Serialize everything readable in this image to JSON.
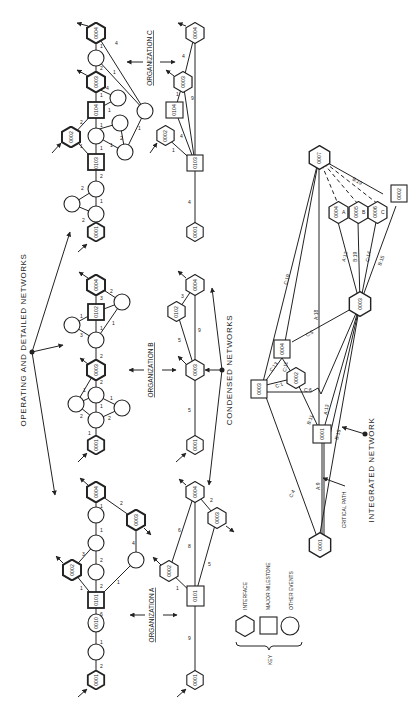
{
  "titles": {
    "operating": "OPERATING AND DETAILED NETWORKS",
    "condensed": "CONDENSED NETWORKS",
    "integrated": "INTEGRATED NETWORK",
    "critical_path": "CRITICAL PATH"
  },
  "organizations": {
    "a": "ORGANIZATION A",
    "b": "ORGANIZATION B",
    "c": "ORGANIZATION C"
  },
  "key": {
    "label": "KEY",
    "items": [
      {
        "shape": "hexagon",
        "label": "INTERFACE"
      },
      {
        "shape": "square",
        "label": "MAJOR MILESTONE"
      },
      {
        "shape": "circle",
        "label": "OTHER EVENTS"
      }
    ]
  },
  "detailed": {
    "a": {
      "nodes": {
        "n0001": "0001",
        "n0010": "0010",
        "n0101": "0101",
        "n0002": "0002",
        "n0003": "0003",
        "n0004": "0004"
      },
      "edges": [
        "2",
        "1",
        "6",
        "1",
        "2",
        "2",
        "3",
        "1",
        "4",
        "2",
        "1",
        "1"
      ]
    },
    "b": {
      "nodes": {
        "n0001": "0001",
        "n0003": "0003",
        "n0102": "0102",
        "n0004": "0004"
      },
      "edges": [
        "1",
        "2",
        "2",
        "1",
        "1",
        "1",
        "2",
        "2",
        "3",
        "1",
        "1",
        "1",
        "3",
        "2"
      ]
    },
    "c": {
      "nodes": {
        "n0001": "0001",
        "n0103": "0103",
        "n0002": "0002",
        "n0104": "0104",
        "n0003": "0003",
        "n0004": "0004"
      },
      "edges": [
        "2",
        "2",
        "1",
        "2",
        "1",
        "1",
        "2",
        "1",
        "1",
        "2",
        "1",
        "1",
        "4",
        "2",
        "1",
        "1",
        "4",
        "1"
      ]
    }
  },
  "condensed": {
    "a": {
      "nodes": {
        "n0001": "0001",
        "n0101": "0101",
        "n0002": "0002",
        "n0003": "0003",
        "n0004": "0004"
      },
      "edges": {
        "e1": "9",
        "e2": "1",
        "e3": "6",
        "e4": "8",
        "e5": "5",
        "e6": "2"
      }
    },
    "b": {
      "nodes": {
        "n0001": "0001",
        "n0003": "0003",
        "n0102": "0102",
        "n0004": "0004"
      },
      "edges": {
        "e1": "5",
        "e2": "5",
        "e3": "9",
        "e4": "3"
      }
    },
    "c": {
      "nodes": {
        "n0001": "0001",
        "n0103": "0103",
        "n0002": "0002",
        "n0104": "0104",
        "n0003": "0003",
        "n0004": "0004"
      },
      "edges": {
        "e1": "4",
        "e2": "1",
        "e3": "4",
        "e4": "1",
        "e5": "9",
        "e6": "4"
      }
    }
  },
  "integrated": {
    "nodes": {
      "n0001": "0001",
      "m0001": "0001",
      "n0002": "0002",
      "n0003": "0003",
      "m0003": "0003",
      "n0004": "0004",
      "n0004a": "0004",
      "n0005b": "0005",
      "n0006c": "0006",
      "n0007": "0007",
      "m0002": "0002"
    },
    "node_subs": {
      "a": "A",
      "b": "B",
      "c": "C"
    },
    "edges": {
      "c19": "C:19",
      "c13": "C:13",
      "c11": "C:11",
      "c1": "C:1",
      "c5": "C:5",
      "c6": "C:6",
      "a18": "A:18",
      "b11": "B:11",
      "a13": "A:13",
      "b15": "B:15",
      "a9": "A:9",
      "c4": "C:4",
      "a12": "A:12",
      "b19": "B:19",
      "c14": "C:14",
      "b15b": "B:15",
      "b19top": "B:19"
    }
  }
}
